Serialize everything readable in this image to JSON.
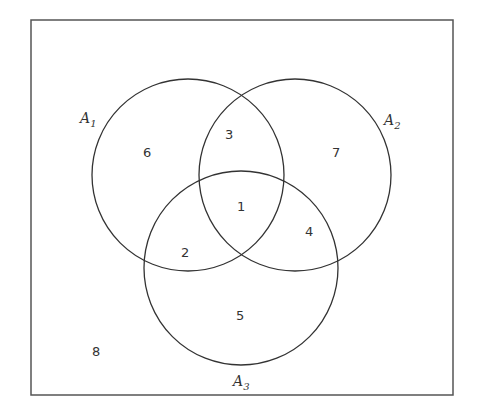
{
  "diagram": {
    "type": "venn",
    "sets": [
      {
        "name": "A",
        "subscript": "1"
      },
      {
        "name": "A",
        "subscript": "2"
      },
      {
        "name": "A",
        "subscript": "3"
      }
    ],
    "regions": {
      "all_three": "1",
      "A1_A3_only": "2",
      "A1_A2_only": "3",
      "A2_A3_only": "4",
      "A3_only": "5",
      "A1_only": "6",
      "A2_only": "7",
      "outside": "8"
    },
    "colors": {
      "stroke": "#333333",
      "background": "#ffffff"
    }
  }
}
